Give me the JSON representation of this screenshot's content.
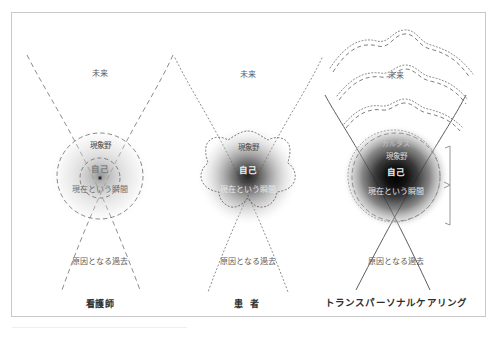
{
  "figure": {
    "title_hidden": "",
    "background_color": "#ffffff",
    "frame_color": "#c9c9c9"
  },
  "common_labels": {
    "future": "未来",
    "causal_past": "原因となる過去",
    "phenomenal_field": "現象野",
    "self": "自己",
    "present_moment": "現在という瞬間",
    "aura": "カルタス"
  },
  "panels": [
    {
      "id": "nurse",
      "caption": "看護師",
      "caption_style": "normal",
      "boundary_style": "dashed",
      "field_intensity": "light",
      "labels": {
        "future": "未来",
        "phenomenal_field": "現象野",
        "self": "自己",
        "present_moment": "現在という瞬間",
        "causal_past": "原因となる過去"
      },
      "has_aura_label": false,
      "has_wave_arcs": false,
      "has_bracket": false
    },
    {
      "id": "patient",
      "caption": "患 者",
      "caption_style": "wide",
      "boundary_style": "dotted-star",
      "field_intensity": "medium",
      "labels": {
        "future": "未来",
        "phenomenal_field": "現象野",
        "self": "自己",
        "present_moment": "現在という瞬間",
        "causal_past": "原因となる過去"
      },
      "has_aura_label": false,
      "has_wave_arcs": false,
      "has_bracket": false
    },
    {
      "id": "transpersonal-caring",
      "caption": "トランスパーソナルケアリング",
      "caption_style": "long",
      "boundary_style": "dashed-and-dotted",
      "field_intensity": "dark",
      "labels": {
        "future": "未来",
        "aura": "カルタス",
        "phenomenal_field": "現象野",
        "self": "自己",
        "present_moment": "現在という瞬間",
        "causal_past": "原因となる過去"
      },
      "has_aura_label": true,
      "has_wave_arcs": true,
      "has_bracket": true
    }
  ]
}
